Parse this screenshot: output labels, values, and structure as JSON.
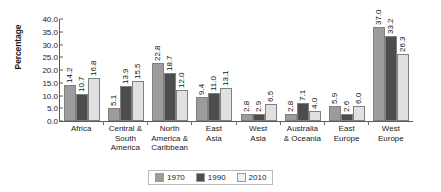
{
  "chart_data": {
    "type": "bar",
    "title": "",
    "xlabel": "",
    "ylabel": "Percentage",
    "ylim": [
      0,
      40
    ],
    "ytick_step": 5,
    "ytick_labels": [
      "40.0",
      "35.0",
      "30.0",
      "25.0",
      "20.0",
      "15.0",
      "10.0",
      "5.0",
      "0.0"
    ],
    "grid": false,
    "legend_position": "bottom-center",
    "categories": [
      "Africa",
      "Central & South America",
      "North America & Caribbean",
      "East Asia",
      "West Asia",
      "Australia & Oceania",
      "East Europe",
      "West Europe"
    ],
    "category_lines": [
      [
        "Africa"
      ],
      [
        "Central &",
        "South",
        "America"
      ],
      [
        "North",
        "America &",
        "Caribbean"
      ],
      [
        "East",
        "Asia"
      ],
      [
        "West",
        "Asia"
      ],
      [
        "Australia",
        "& Oceania"
      ],
      [
        "East",
        "Europe"
      ],
      [
        "West",
        "Europe"
      ]
    ],
    "series": [
      {
        "name": "1970",
        "color": "#9c9c9c",
        "values": [
          14.2,
          5.1,
          22.8,
          9.4,
          2.8,
          2.8,
          5.9,
          37.0
        ],
        "labels": [
          "14.2",
          "5.1",
          "22.8",
          "9.4",
          "2.8",
          "2.8",
          "5.9",
          "37.0"
        ]
      },
      {
        "name": "1990",
        "color": "#4d4d4d",
        "values": [
          10.7,
          13.9,
          18.7,
          11.0,
          2.9,
          7.1,
          2.6,
          33.2
        ],
        "labels": [
          "10.7",
          "13.9",
          "18.7",
          "11.0",
          "2.9",
          "7.1",
          "2.6",
          "33.2"
        ]
      },
      {
        "name": "2010",
        "color": "#e0e0e0",
        "values": [
          16.8,
          15.5,
          12.0,
          13.1,
          6.5,
          4.0,
          6.0,
          26.3
        ],
        "labels": [
          "16.8",
          "15.5",
          "12.0",
          "13.1",
          "6.5",
          "4.0",
          "6.0",
          "26.3"
        ]
      }
    ],
    "legend": [
      {
        "label": "1970",
        "color": "#9c9c9c"
      },
      {
        "label": "1990",
        "color": "#4d4d4d"
      },
      {
        "label": "2010",
        "color": "#efefef"
      }
    ]
  }
}
